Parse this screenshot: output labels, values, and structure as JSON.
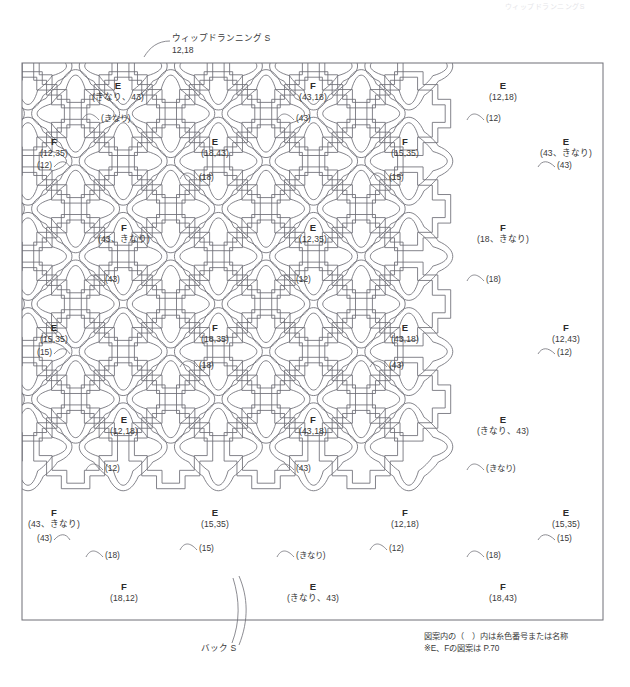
{
  "header": {
    "cut_text": "ウィップドランニングS"
  },
  "callouts": [
    {
      "name": "whipped-running-stitch",
      "label_line1": "ウィップドランニング S",
      "label_line2": "12,18",
      "x": 172,
      "y": 33,
      "leader": "M 170 41 C 158 41 150 47 144 57"
    },
    {
      "name": "back-stitch",
      "label_line1": "バック S",
      "label_line2": "",
      "x": 201,
      "y": 643,
      "leader": "M 232 643 C 240 622 240 600 233 578"
    }
  ],
  "footnote": {
    "line1": "図案内の（　）内は糸色番号または名称",
    "line2": "※E、Fの図案は P.70",
    "x": 424,
    "y": 631
  },
  "frame": {
    "x": 22,
    "y": 63,
    "width": 581,
    "height": 557,
    "stroke": "#6e6e76"
  },
  "colors": {
    "line": "#6e6e76",
    "line_light": "#8c8c94",
    "text": "#3a3a3a",
    "background": "#ffffff"
  },
  "motifs": [
    {
      "id": "r0c0",
      "letter": "E",
      "colors": "(きなり、43)",
      "x": 118,
      "y": 80,
      "tag": "(きなり)",
      "tag_x": 101,
      "tag_y": 119,
      "tag_side": "right",
      "tag_leader": "M 99 120 C 92 112 86 112 82 120"
    },
    {
      "id": "r0c1",
      "letter": "F",
      "colors": "(43,18)",
      "x": 313,
      "y": 80,
      "tag": "(43)",
      "tag_x": 296,
      "tag_y": 119,
      "tag_side": "right",
      "tag_leader": "M 294 120 C 287 112 281 112 277 120"
    },
    {
      "id": "r0c2",
      "letter": "E",
      "colors": "(12,18)",
      "x": 503,
      "y": 80,
      "tag": "(12)",
      "tag_x": 486,
      "tag_y": 119,
      "tag_side": "right",
      "tag_leader": "M 484 120 C 477 112 471 112 467 120"
    },
    {
      "id": "r1c0",
      "letter": "F",
      "colors": "(12,35)",
      "x": 54,
      "y": 136,
      "tag": "(12)",
      "tag_x": 52,
      "tag_y": 166,
      "tag_side": "left",
      "tag_leader": "M 54 167 C 60 160 66 160 70 167"
    },
    {
      "id": "r1c1",
      "letter": "E",
      "colors": "(18,43)",
      "x": 215,
      "y": 136,
      "tag": "(18)",
      "tag_x": 199,
      "tag_y": 178,
      "tag_side": "right",
      "tag_leader": "M 197 179 C 190 171 184 171 180 179"
    },
    {
      "id": "r1c2",
      "letter": "F",
      "colors": "(15,35)",
      "x": 405,
      "y": 136,
      "tag": "(15)",
      "tag_x": 389,
      "tag_y": 178,
      "tag_side": "right",
      "tag_leader": "M 387 179 C 380 171 374 171 370 179"
    },
    {
      "id": "r1c3",
      "letter": "E",
      "colors": "(43、きなり)",
      "x": 566,
      "y": 136,
      "tag": "(43)",
      "tag_x": 557,
      "tag_y": 166,
      "tag_side": "right",
      "tag_leader": "M 555 167 C 548 160 542 160 538 167"
    },
    {
      "id": "r2c0",
      "letter": "F",
      "colors": "(43、きなり)",
      "x": 124,
      "y": 222,
      "tag": "(43)",
      "tag_x": 105,
      "tag_y": 280,
      "tag_side": "right",
      "tag_leader": "M 103 281 C 96 273 90 273 86 281"
    },
    {
      "id": "r2c1",
      "letter": "E",
      "colors": "(12,35)",
      "x": 313,
      "y": 222,
      "tag": "(12)",
      "tag_x": 296,
      "tag_y": 280,
      "tag_side": "right",
      "tag_leader": "M 294 281 C 287 273 281 273 277 281"
    },
    {
      "id": "r2c2",
      "letter": "F",
      "colors": "(18、きなり)",
      "x": 503,
      "y": 222,
      "tag": "(18)",
      "tag_x": 486,
      "tag_y": 280,
      "tag_side": "right",
      "tag_leader": "M 484 281 C 477 273 471 273 467 281"
    },
    {
      "id": "r3c0",
      "letter": "E",
      "colors": "(15,35)",
      "x": 54,
      "y": 322,
      "tag": "(15)",
      "tag_x": 52,
      "tag_y": 353,
      "tag_side": "left",
      "tag_leader": "M 54 354 C 60 347 66 347 70 354"
    },
    {
      "id": "r3c1",
      "letter": "F",
      "colors": "(18,35)",
      "x": 215,
      "y": 322,
      "tag": "(18)",
      "tag_x": 199,
      "tag_y": 366,
      "tag_side": "right",
      "tag_leader": "M 197 367 C 190 359 184 359 180 367"
    },
    {
      "id": "r3c2",
      "letter": "E",
      "colors": "(43,18)",
      "x": 405,
      "y": 322,
      "tag": "(43)",
      "tag_x": 389,
      "tag_y": 366,
      "tag_side": "right",
      "tag_leader": "M 387 367 C 380 359 374 359 370 367"
    },
    {
      "id": "r3c3",
      "letter": "F",
      "colors": "(12,43)",
      "x": 566,
      "y": 322,
      "tag": "(12)",
      "tag_x": 557,
      "tag_y": 353,
      "tag_side": "right",
      "tag_leader": "M 555 354 C 548 347 542 347 538 354"
    },
    {
      "id": "r4c0",
      "letter": "E",
      "colors": "(12,18)",
      "x": 124,
      "y": 414,
      "tag": "(12)",
      "tag_x": 105,
      "tag_y": 469,
      "tag_side": "right",
      "tag_leader": "M 103 470 C 96 462 90 462 86 470"
    },
    {
      "id": "r4c1",
      "letter": "F",
      "colors": "(43,18)",
      "x": 313,
      "y": 414,
      "tag": "(43)",
      "tag_x": 296,
      "tag_y": 469,
      "tag_side": "right",
      "tag_leader": "M 294 470 C 287 462 281 462 277 470"
    },
    {
      "id": "r4c2",
      "letter": "E",
      "colors": "(きなり、43)",
      "x": 503,
      "y": 414,
      "tag": "(きなり)",
      "tag_x": 486,
      "tag_y": 469,
      "tag_side": "right",
      "tag_leader": "M 484 470 C 477 462 471 462 467 470"
    },
    {
      "id": "r5c0",
      "letter": "F",
      "colors": "(43、きなり)",
      "x": 54,
      "y": 507,
      "tag": "(43)",
      "tag_x": 52,
      "tag_y": 539,
      "tag_side": "left",
      "tag_leader": "M 54 540 C 60 533 66 533 70 540"
    },
    {
      "id": "r5c1",
      "letter": "E",
      "colors": "(15,35)",
      "x": 215,
      "y": 507,
      "tag": "(15)",
      "tag_x": 199,
      "tag_y": 549,
      "tag_side": "right",
      "tag_leader": "M 197 550 C 190 542 184 542 180 550"
    },
    {
      "id": "r5c2",
      "letter": "F",
      "colors": "(12,18)",
      "x": 405,
      "y": 507,
      "tag": "(12)",
      "tag_x": 389,
      "tag_y": 549,
      "tag_side": "right",
      "tag_leader": "M 387 550 C 380 542 374 542 370 550"
    },
    {
      "id": "r5c3",
      "letter": "E",
      "colors": "(15,35)",
      "x": 566,
      "y": 507,
      "tag": "(15)",
      "tag_x": 557,
      "tag_y": 539,
      "tag_side": "right",
      "tag_leader": "M 555 540 C 548 533 542 533 538 540"
    },
    {
      "id": "r6c0",
      "letter": "F",
      "colors": "(18,12)",
      "x": 124,
      "y": 581,
      "tag": "(18)",
      "tag_x": 105,
      "tag_y": 556,
      "tag_side": "right",
      "tag_leader": "M 103 557 C 96 549 90 549 86 557"
    },
    {
      "id": "r6c1",
      "letter": "E",
      "colors": "(きなり、43)",
      "x": 313,
      "y": 581,
      "tag": "(きなり)",
      "tag_x": 296,
      "tag_y": 556,
      "tag_side": "right",
      "tag_leader": "M 294 557 C 287 549 281 549 277 557"
    },
    {
      "id": "r6c2",
      "letter": "F",
      "colors": "(18,43)",
      "x": 503,
      "y": 581,
      "tag": "(18)",
      "tag_x": 486,
      "tag_y": 556,
      "tag_side": "right",
      "tag_leader": "M 484 557 C 477 549 471 549 467 557"
    }
  ],
  "lattice": {
    "cell": 95.2,
    "origin_x": 28,
    "origin_y": 66,
    "cols": 7,
    "rows": 7
  }
}
